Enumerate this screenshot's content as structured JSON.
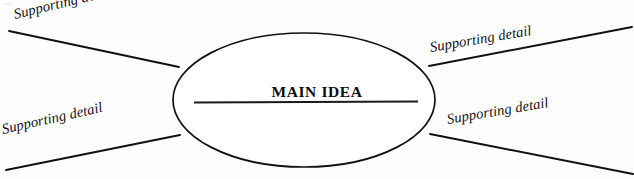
{
  "diagram": {
    "type": "main-idea-web",
    "center": {
      "label": "MAIN IDEA",
      "shape": "ellipse",
      "has_write_on_line": true,
      "cx": 304,
      "cy": 100,
      "rx": 131,
      "ry": 67,
      "stroke_color": "#111111",
      "fill_color": "#ffffff"
    },
    "write_line": {
      "x1": 194,
      "y1": 102,
      "x2": 418,
      "y2": 102,
      "color": "#1a1a1a"
    },
    "branches": [
      {
        "id": "top-left",
        "label": "Supporting detail",
        "angle_deg": -13.5,
        "line": {
          "x1": 9,
          "y1": 31,
          "x2": 179,
          "y2": 67
        }
      },
      {
        "id": "bottom-left",
        "label": "Supporting detail",
        "angle_deg": -12.5,
        "line": {
          "x1": 6,
          "y1": 170,
          "x2": 180,
          "y2": 135
        }
      },
      {
        "id": "top-right",
        "label": "Supporting detail",
        "angle_deg": -9.5,
        "line": {
          "x1": 429,
          "y1": 66,
          "x2": 632,
          "y2": 27
        }
      },
      {
        "id": "bottom-right",
        "label": "Supporting detail",
        "angle_deg": -9.5,
        "line": {
          "x1": 430,
          "y1": 134,
          "x2": 633,
          "y2": 174
        }
      }
    ],
    "page": {
      "background_color": "#fdfdfd",
      "ink_color": "#111111",
      "width": 634,
      "height": 179
    },
    "scan_artifact": {
      "text": "Supporting"
    }
  }
}
